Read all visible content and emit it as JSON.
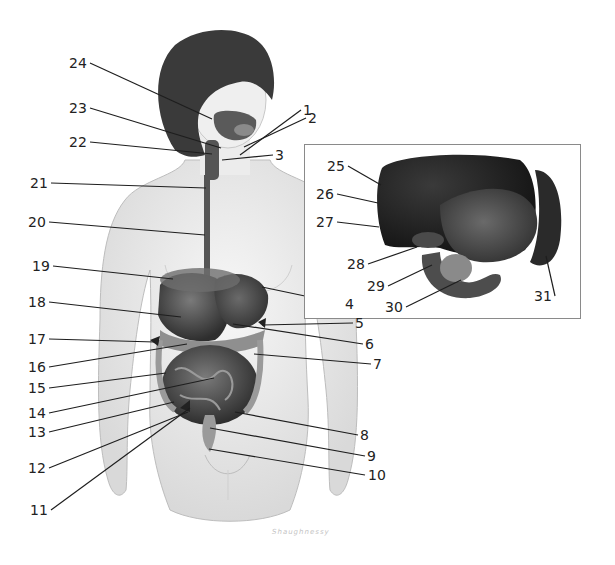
{
  "diagram": {
    "signature": "Shaughnessy",
    "main_labels": [
      {
        "n": "1",
        "x": 307,
        "y": 110,
        "tx": 240,
        "ty": 155
      },
      {
        "n": "2",
        "x": 312,
        "y": 118,
        "tx": 244,
        "ty": 147
      },
      {
        "n": "3",
        "x": 279,
        "y": 155,
        "tx": 222,
        "ty": 160
      },
      {
        "n": "4",
        "x": 349,
        "y": 304,
        "tx": 262,
        "ty": 287
      },
      {
        "n": "5",
        "x": 359,
        "y": 323,
        "tx": 262,
        "ty": 325
      },
      {
        "n": "6",
        "x": 369,
        "y": 344,
        "tx": 233,
        "ty": 324
      },
      {
        "n": "7",
        "x": 377,
        "y": 364,
        "tx": 254,
        "ty": 354
      },
      {
        "n": "8",
        "x": 364,
        "y": 435,
        "tx": 235,
        "ty": 412
      },
      {
        "n": "9",
        "x": 371,
        "y": 456,
        "tx": 210,
        "ty": 428
      },
      {
        "n": "10",
        "x": 377,
        "y": 475,
        "tx": 209,
        "ty": 449
      },
      {
        "n": "11",
        "x": 39,
        "y": 510,
        "tx": 190,
        "ty": 408
      },
      {
        "n": "12",
        "x": 37,
        "y": 468,
        "tx": 188,
        "ty": 412
      },
      {
        "n": "13",
        "x": 37,
        "y": 432,
        "tx": 174,
        "ty": 402
      },
      {
        "n": "14",
        "x": 37,
        "y": 413,
        "tx": 214,
        "ty": 378
      },
      {
        "n": "15",
        "x": 37,
        "y": 388,
        "tx": 166,
        "ty": 373
      },
      {
        "n": "16",
        "x": 37,
        "y": 367,
        "tx": 187,
        "ty": 344
      },
      {
        "n": "17",
        "x": 37,
        "y": 339,
        "tx": 155,
        "ty": 342
      },
      {
        "n": "18",
        "x": 37,
        "y": 302,
        "tx": 181,
        "ty": 317
      },
      {
        "n": "19",
        "x": 41,
        "y": 266,
        "tx": 173,
        "ty": 279
      },
      {
        "n": "20",
        "x": 37,
        "y": 222,
        "tx": 205,
        "ty": 235
      },
      {
        "n": "21",
        "x": 39,
        "y": 183,
        "tx": 206,
        "ty": 188
      },
      {
        "n": "22",
        "x": 78,
        "y": 142,
        "tx": 212,
        "ty": 154
      },
      {
        "n": "23",
        "x": 78,
        "y": 108,
        "tx": 221,
        "ty": 148
      },
      {
        "n": "24",
        "x": 78,
        "y": 63,
        "tx": 212,
        "ty": 119
      }
    ],
    "inset_labels": [
      {
        "n": "25",
        "x": 336,
        "y": 166,
        "tx": 381,
        "ty": 185
      },
      {
        "n": "26",
        "x": 325,
        "y": 194,
        "tx": 378,
        "ty": 203
      },
      {
        "n": "27",
        "x": 325,
        "y": 222,
        "tx": 379,
        "ty": 227
      },
      {
        "n": "28",
        "x": 356,
        "y": 264,
        "tx": 417,
        "ty": 247
      },
      {
        "n": "29",
        "x": 376,
        "y": 286,
        "tx": 432,
        "ty": 265
      },
      {
        "n": "30",
        "x": 394,
        "y": 307,
        "tx": 461,
        "ty": 280
      },
      {
        "n": "31",
        "x": 543,
        "y": 296,
        "tx": 546,
        "ty": 256
      }
    ]
  }
}
